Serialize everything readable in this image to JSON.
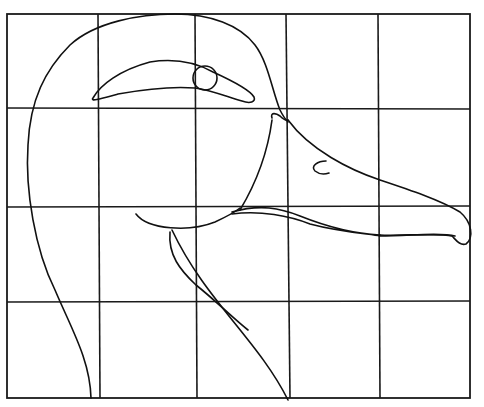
{
  "figure": {
    "grid": {
      "columns": 5,
      "rows": 4,
      "x_lines": [
        7,
        98,
        195,
        288,
        378,
        470
      ],
      "y_lines": [
        14,
        108,
        207,
        302,
        398
      ]
    },
    "colors": {
      "background": "#ffffff",
      "line": "#111111"
    },
    "parts": [
      {
        "name": "head-outline"
      },
      {
        "name": "eye-stripe"
      },
      {
        "name": "eye"
      },
      {
        "name": "upper-bill"
      },
      {
        "name": "nostril"
      },
      {
        "name": "lower-bill"
      },
      {
        "name": "chin-line"
      },
      {
        "name": "neck-front"
      },
      {
        "name": "neck-back"
      }
    ]
  }
}
